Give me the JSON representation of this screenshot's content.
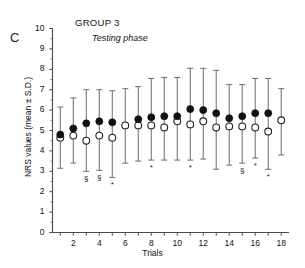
{
  "figure": {
    "panel_label": "C",
    "title": "GROUP 3",
    "subtitle": "Testing phase",
    "xlabel": "Trials",
    "ylabel": "NRS values (mean ± S.D.)"
  },
  "axes": {
    "ylim": [
      0,
      10
    ],
    "yticks": [
      0,
      1,
      2,
      3,
      4,
      5,
      6,
      7,
      8,
      9,
      10
    ],
    "ytick_labels": [
      "0",
      "1",
      "2",
      "3",
      "4",
      "5",
      "6",
      "7",
      "8",
      "9",
      "10"
    ],
    "xlim": [
      0.4,
      18.6
    ],
    "xticks": [
      1,
      2,
      3,
      4,
      5,
      6,
      7,
      8,
      9,
      10,
      11,
      12,
      13,
      14,
      15,
      16,
      17,
      18
    ],
    "xtick_labels_shown": [
      "2",
      "4",
      "6",
      "8",
      "10",
      "12",
      "14",
      "16",
      "18"
    ],
    "grid": false
  },
  "colors": {
    "filled_marker": "#111111",
    "open_marker_edge": "#222222",
    "open_marker_fill": "#ffffff",
    "errorbar": "#6b6b6b",
    "axis": "#4a4a4a",
    "text": "#111111"
  },
  "chart_data": {
    "type": "scatter",
    "title": "GROUP 3",
    "subtitle": "Testing phase",
    "xlabel": "Trials",
    "ylabel": "NRS values (mean ± S.D.)",
    "ylim": [
      0,
      10
    ],
    "xlim": [
      0.4,
      18.6
    ],
    "grid": false,
    "legend_position": "none",
    "x": [
      1,
      2,
      3,
      4,
      5,
      6,
      7,
      8,
      9,
      10,
      11,
      12,
      13,
      14,
      15,
      16,
      17,
      18
    ],
    "series": [
      {
        "name": "filled-circles",
        "marker": "filled circle",
        "values": [
          4.8,
          5.1,
          5.35,
          5.45,
          5.4,
          null,
          5.55,
          5.65,
          5.7,
          5.7,
          6.05,
          6.0,
          5.85,
          5.6,
          5.7,
          5.85,
          5.85,
          null
        ],
        "err_up": [
          6.15,
          6.6,
          7.0,
          7.0,
          6.95,
          null,
          7.15,
          7.55,
          7.6,
          7.6,
          8.05,
          8.05,
          7.95,
          7.25,
          7.25,
          7.55,
          7.55,
          null
        ],
        "err_low": [
          3.15,
          3.4,
          3.0,
          3.05,
          2.7,
          null,
          3.5,
          3.55,
          3.55,
          3.55,
          3.55,
          3.6,
          3.1,
          3.3,
          3.4,
          3.65,
          3.1,
          null
        ]
      },
      {
        "name": "open-circles",
        "marker": "open circle",
        "values": [
          4.65,
          4.75,
          4.5,
          4.75,
          4.65,
          5.25,
          5.25,
          5.25,
          5.15,
          5.45,
          5.3,
          5.45,
          5.15,
          5.2,
          5.2,
          5.15,
          4.95,
          5.5
        ],
        "err_up": [
          6.15,
          6.6,
          7.0,
          7.0,
          6.95,
          7.05,
          7.15,
          7.55,
          7.6,
          7.6,
          8.05,
          8.05,
          7.95,
          7.25,
          7.25,
          7.55,
          7.55,
          7.05
        ],
        "err_low": [
          3.15,
          3.4,
          3.0,
          3.05,
          2.7,
          3.4,
          3.5,
          3.55,
          3.55,
          3.55,
          3.55,
          3.6,
          3.1,
          3.3,
          3.4,
          3.65,
          3.1,
          3.8
        ]
      }
    ],
    "annotations": [
      {
        "x": 3,
        "symbol": "§",
        "y_px_below_axis": true
      },
      {
        "x": 4,
        "symbol": "§"
      },
      {
        "x": 5,
        "symbol": "*"
      },
      {
        "x": 8,
        "symbol": "*"
      },
      {
        "x": 11,
        "symbol": "*"
      },
      {
        "x": 15,
        "symbol": "§"
      },
      {
        "x": 16,
        "symbol": "*"
      },
      {
        "x": 17,
        "symbol": "*"
      }
    ]
  }
}
